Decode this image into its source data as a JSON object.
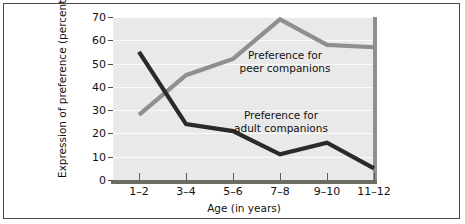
{
  "chart_data": {
    "type": "line",
    "title": "",
    "xlabel": "Age (in years)",
    "ylabel": "Expression of preference (percent)",
    "categories": [
      "1–2",
      "3–4",
      "5–6",
      "7–8",
      "9–10",
      "11–12"
    ],
    "ylim": [
      0,
      70
    ],
    "yticks": [
      0,
      10,
      20,
      30,
      40,
      50,
      60,
      70
    ],
    "ytick_labels": [
      "0",
      "10",
      "20",
      "30",
      "40",
      "50",
      "60",
      "70"
    ],
    "grid": true,
    "legend_position": "inline-annotations",
    "series": [
      {
        "name": "Preference for peer companions",
        "values": [
          28,
          45,
          52,
          69,
          58,
          57
        ],
        "color": "#8f8f8f"
      },
      {
        "name": "Preference for adult companions",
        "values": [
          55,
          24,
          21,
          11,
          16,
          5
        ],
        "color": "#2a2a2a"
      }
    ],
    "annotations": [
      {
        "id": "peer",
        "line1": "Preference for",
        "line2": "peer companions"
      },
      {
        "id": "adult",
        "line1": "Preference for",
        "line2": "adult companions"
      }
    ],
    "colors": {
      "plot_background": "#e9e9e9",
      "gridline": "#fbfbfb",
      "axis": "#6d6d63",
      "frame": "#4a4a4a",
      "peer_series": "#8f8f8f",
      "adult_series": "#2a2a2a",
      "page_background": "#ffffff"
    }
  }
}
